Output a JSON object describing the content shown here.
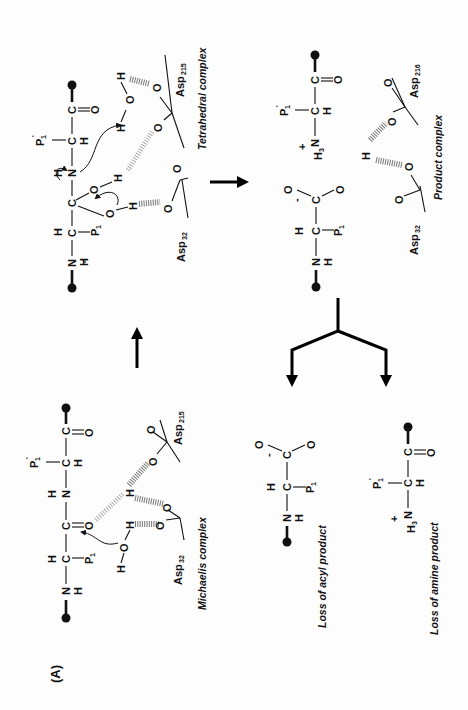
{
  "figure": {
    "panel_label": "(A)",
    "orientation": "rotated 90° counter-clockwise",
    "complexes": {
      "michaelis": {
        "label": "Michaelis complex",
        "asp_a": "Asp",
        "asp_a_sub": "32",
        "asp_b": "Asp",
        "asp_b_sub": "215"
      },
      "tetrahedral": {
        "label": "Tetrahedral complex",
        "asp_a": "Asp",
        "asp_a_sub": "32",
        "asp_b": "Asp",
        "asp_b_sub": "215"
      },
      "product": {
        "label": "Product complex",
        "asp_a": "Asp",
        "asp_a_sub": "32",
        "asp_b": "Asp",
        "asp_b_sub": "216"
      }
    },
    "outcomes": {
      "acyl": {
        "label": "Loss of acyl product"
      },
      "amine": {
        "label": "Loss of amine product"
      }
    },
    "atoms": {
      "C": "C",
      "N": "N",
      "O": "O",
      "H": "H",
      "P": "P",
      "p1_sub": "1",
      "prime": "'",
      "h3": "H",
      "h3_sub": "3",
      "plus": "+",
      "minus": "-"
    }
  }
}
